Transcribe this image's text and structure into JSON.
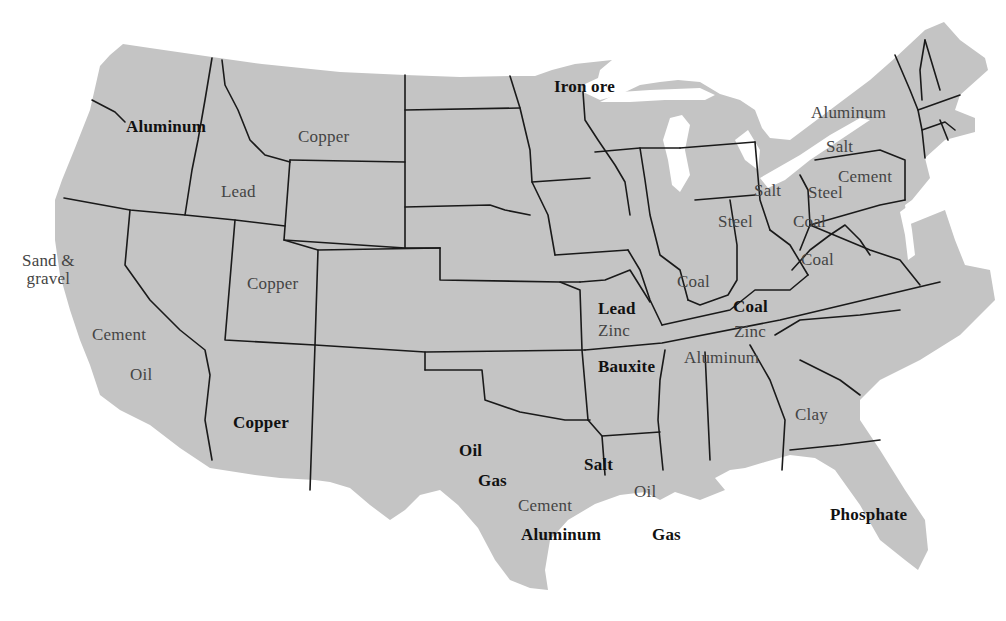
{
  "map": {
    "title": "",
    "land_color": "#c4c4c4",
    "border_color": "#1a1a1a",
    "background_color": "#ffffff",
    "labels": [
      {
        "id": "wa-aluminum",
        "text": "Aluminum",
        "x": 126,
        "y": 118,
        "bold": true
      },
      {
        "id": "mt-copper",
        "text": "Copper",
        "x": 298,
        "y": 128,
        "bold": false
      },
      {
        "id": "mn-iron-ore",
        "text": "Iron ore",
        "x": 554,
        "y": 78,
        "bold": true
      },
      {
        "id": "id-lead",
        "text": "Lead",
        "x": 221,
        "y": 183,
        "bold": false
      },
      {
        "id": "ny-aluminum",
        "text": "Aluminum",
        "x": 811,
        "y": 104,
        "bold": false
      },
      {
        "id": "ny-salt",
        "text": "Salt",
        "x": 826,
        "y": 138,
        "bold": false
      },
      {
        "id": "pa-cement",
        "text": "Cement",
        "x": 838,
        "y": 168,
        "bold": false
      },
      {
        "id": "mi-salt",
        "text": "Salt",
        "x": 754,
        "y": 182,
        "bold": false
      },
      {
        "id": "oh-steel",
        "text": "Steel",
        "x": 808,
        "y": 184,
        "bold": false
      },
      {
        "id": "in-steel",
        "text": "Steel",
        "x": 718,
        "y": 213,
        "bold": false
      },
      {
        "id": "oh-coal",
        "text": "Coal",
        "x": 793,
        "y": 213,
        "bold": false
      },
      {
        "id": "wv-coal",
        "text": "Coal",
        "x": 801,
        "y": 251,
        "bold": false
      },
      {
        "id": "ca-sand-gravel",
        "text": "Sand &\ngravel",
        "x": 22,
        "y": 252,
        "bold": false,
        "multiline": true
      },
      {
        "id": "ut-copper",
        "text": "Copper",
        "x": 247,
        "y": 275,
        "bold": false
      },
      {
        "id": "il-coal",
        "text": "Coal",
        "x": 677,
        "y": 273,
        "bold": false
      },
      {
        "id": "ky-coal",
        "text": "Coal",
        "x": 733,
        "y": 298,
        "bold": true
      },
      {
        "id": "mo-lead",
        "text": "Lead",
        "x": 598,
        "y": 300,
        "bold": true
      },
      {
        "id": "mo-zinc",
        "text": "Zinc",
        "x": 598,
        "y": 322,
        "bold": false
      },
      {
        "id": "tn-zinc",
        "text": "Zinc",
        "x": 734,
        "y": 323,
        "bold": false
      },
      {
        "id": "ca-cement",
        "text": "Cement",
        "x": 92,
        "y": 326,
        "bold": false
      },
      {
        "id": "tn-aluminum",
        "text": "Aluminum",
        "x": 684,
        "y": 349,
        "bold": false
      },
      {
        "id": "ar-bauxite",
        "text": "Bauxite",
        "x": 598,
        "y": 358,
        "bold": true
      },
      {
        "id": "ca-oil",
        "text": "Oil",
        "x": 130,
        "y": 366,
        "bold": false
      },
      {
        "id": "ga-clay",
        "text": "Clay",
        "x": 795,
        "y": 406,
        "bold": false
      },
      {
        "id": "az-copper",
        "text": "Copper",
        "x": 233,
        "y": 414,
        "bold": true
      },
      {
        "id": "tx-oil",
        "text": "Oil",
        "x": 459,
        "y": 442,
        "bold": true
      },
      {
        "id": "tx-gas",
        "text": "Gas",
        "x": 478,
        "y": 472,
        "bold": true
      },
      {
        "id": "la-salt",
        "text": "Salt",
        "x": 584,
        "y": 456,
        "bold": true
      },
      {
        "id": "tx-cement",
        "text": "Cement",
        "x": 518,
        "y": 497,
        "bold": false
      },
      {
        "id": "la-oil",
        "text": "Oil",
        "x": 634,
        "y": 483,
        "bold": false
      },
      {
        "id": "fl-phosphate",
        "text": "Phosphate",
        "x": 830,
        "y": 506,
        "bold": true
      },
      {
        "id": "tx-aluminum",
        "text": "Aluminum",
        "x": 521,
        "y": 526,
        "bold": true
      },
      {
        "id": "la-gas",
        "text": "Gas",
        "x": 652,
        "y": 526,
        "bold": true
      }
    ]
  }
}
